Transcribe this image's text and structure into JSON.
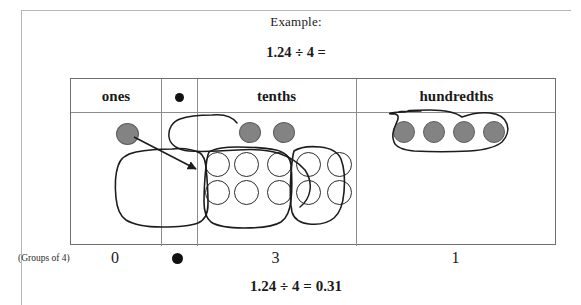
{
  "header": {
    "example_label": "Example:",
    "problem": "1.24 ÷ 4 ="
  },
  "table": {
    "columns": [
      {
        "label": "ones",
        "icon": null
      },
      {
        "label": "",
        "icon": "decimal-point-dot"
      },
      {
        "label": "tenths",
        "icon": null
      },
      {
        "label": "hundredths",
        "icon": null
      }
    ]
  },
  "counters": {
    "ones": {
      "filled_count": 1,
      "open_count": 0
    },
    "tenths": {
      "filled_count": 2,
      "open_count": 10,
      "group_sizes": [
        4,
        4,
        2
      ]
    },
    "hundredths": {
      "filled_count": 4,
      "open_count": 0,
      "group_sizes": [
        4
      ]
    }
  },
  "annotations": {
    "arrow": "regroup-one-to-tenths",
    "loops": [
      "loop-tenths-filled",
      "loop-tenths-group-1",
      "loop-tenths-group-2",
      "loop-tenths-group-3",
      "loop-hundredths-group"
    ]
  },
  "answer_row": {
    "groups_label": "(Groups of 4)",
    "ones_digit": "0",
    "decimal_icon": "decimal-point-dot",
    "tenths_digit": "3",
    "hundredths_digit": "1"
  },
  "footer": {
    "final_answer": "1.24 ÷ 4 = 0.31"
  },
  "colors": {
    "disc_filled": "#838383",
    "disc_filled_border": "#5e5e5e",
    "disc_open_border": "#2b2b2b",
    "table_border": "#6f6f6f",
    "page_border": "#b6b6b6",
    "ink": "#1a1a1a"
  }
}
